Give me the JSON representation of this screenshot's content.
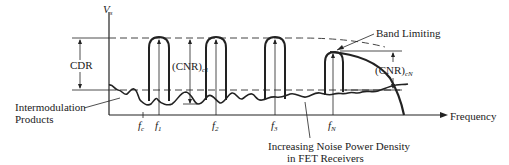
{
  "diagram": {
    "y_axis_label": "V",
    "y_axis_sub": "s",
    "x_axis_label": "Frequency",
    "cdr_label": "CDR",
    "cnr_c1_label": "(CNR)",
    "cnr_c1_sub": "c1",
    "cnr_cN_label": "(CNR)",
    "cnr_cN_sub": "cN",
    "band_limiting_label": "Band Limiting",
    "intermod_label_line1": "Intermodulation",
    "intermod_label_line2": "Products",
    "noise_label_line1": "Increasing Noise Power Density",
    "noise_label_line2": "in FET Receivers",
    "ticks": [
      {
        "f": "f",
        "sub": "c"
      },
      {
        "f": "f",
        "sub": "1"
      },
      {
        "f": "f",
        "sub": "2"
      },
      {
        "f": "f",
        "sub": "3"
      },
      {
        "f": "f",
        "sub": "N"
      }
    ],
    "colors": {
      "ink": "#222222",
      "background": "#ffffff"
    }
  }
}
